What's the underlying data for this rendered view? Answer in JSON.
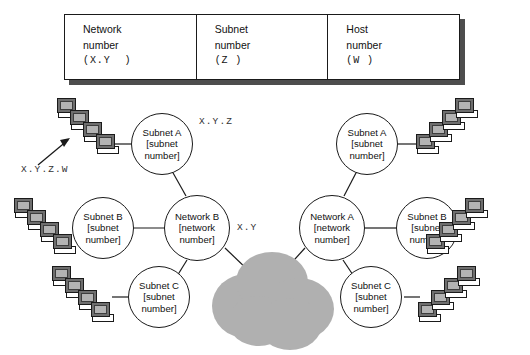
{
  "address_format_table": {
    "name": "ip-address-format",
    "cells": [
      {
        "title": "Network",
        "subtitle": "number",
        "code": "(X.Y  )"
      },
      {
        "title": "Subnet",
        "subtitle": "number",
        "code": "(Z )"
      },
      {
        "title": "Host",
        "subtitle": "number",
        "code": "(W )"
      }
    ]
  },
  "diagram": {
    "annotations": [
      {
        "key": "subnet_addr",
        "text": "X.Y.Z"
      },
      {
        "key": "host_addr",
        "text": "X.Y.Z.W"
      },
      {
        "key": "network_addr",
        "text": "X.Y"
      }
    ],
    "left_group": {
      "network": {
        "line1": "Network B",
        "line2": "[network",
        "line3": "number]"
      },
      "subnets": [
        {
          "line1": "Subnet A",
          "line2": "[subnet",
          "line3": "number]"
        },
        {
          "line1": "Subnet B",
          "line2": "[subnet",
          "line3": "number]"
        },
        {
          "line1": "Subnet C",
          "line2": "[subnet",
          "line3": "number]"
        }
      ]
    },
    "right_group": {
      "network": {
        "line1": "Network A",
        "line2": "[network",
        "line3": "number]"
      },
      "subnets": [
        {
          "line1": "Subnet A",
          "line2": "[subnet",
          "line3": "number]"
        },
        {
          "line1": "Subnet B",
          "line2": "[subnet",
          "line3": "number]"
        },
        {
          "line1": "Subnet C",
          "line2": "[subnet",
          "line3": "number]"
        }
      ]
    },
    "cloud": {
      "name": "internet-cloud",
      "color": "#b0b0b0"
    },
    "host_pointer": {
      "name": "host-address-arrow"
    },
    "computers_per_cluster": 4,
    "colors": {
      "line": "#1a1a1a",
      "screen": "#b3b3b3",
      "monitor_body": "#6e6e6e",
      "cloud": "#b0b0b0",
      "table_shadow": "#4d4d4d"
    }
  }
}
